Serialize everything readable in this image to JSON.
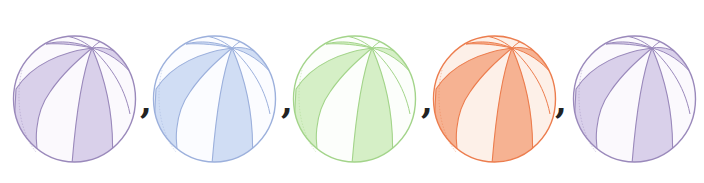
{
  "sequence": {
    "items": [
      {
        "kind": "ball",
        "name": "beach-ball-purple",
        "fill": "#d9d0ea",
        "light": "#fbf9fd",
        "stroke": "#9a89bb",
        "left": 12
      },
      {
        "kind": "separator",
        "text": ",",
        "left": 140
      },
      {
        "kind": "ball",
        "name": "beach-ball-blue",
        "fill": "#d0ddf4",
        "light": "#fbfcff",
        "stroke": "#9cb0dc",
        "left": 152
      },
      {
        "kind": "separator",
        "text": ",",
        "left": 281
      },
      {
        "kind": "ball",
        "name": "beach-ball-green",
        "fill": "#d5efc6",
        "light": "#fcfefb",
        "stroke": "#a3d48a",
        "left": 292
      },
      {
        "kind": "separator",
        "text": ",",
        "left": 421
      },
      {
        "kind": "ball",
        "name": "beach-ball-orange",
        "fill": "#f6b292",
        "light": "#fdf0e8",
        "stroke": "#ec7d4e",
        "left": 432
      },
      {
        "kind": "separator",
        "text": ",",
        "left": 555
      },
      {
        "kind": "ball",
        "name": "beach-ball-purple-2",
        "fill": "#d9d0ea",
        "light": "#fbf9fd",
        "stroke": "#9a89bb",
        "left": 572
      }
    ]
  },
  "separators": [
    ",",
    ",",
    ",",
    ","
  ]
}
